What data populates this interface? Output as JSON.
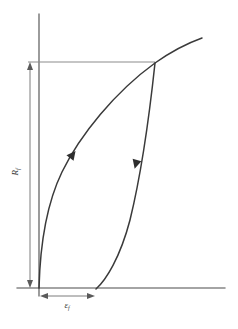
{
  "figure": {
    "background_color": "#ffffff",
    "width": 238,
    "height": 329
  },
  "labels": {
    "vertical_dimension": {
      "symbol": "R",
      "subscript": "f",
      "full_text": "Rf",
      "orientation": "rotated-90",
      "meaning": "strength at failure"
    },
    "horizontal_dimension": {
      "symbol": "ε",
      "subscript": "f",
      "full_text": "εf",
      "orientation": "horizontal",
      "meaning": "permanent strain at failure"
    }
  },
  "colors": {
    "axis": "#4a4a4a",
    "reference_line": "#8c8c8c",
    "dimension_line": "#6e6e6e",
    "curve": "#3a3a3a",
    "arrow": "#2e2e2e",
    "label_text": "#3a3a3a"
  },
  "chart_data": {
    "type": "line",
    "title": "",
    "xlabel": "εf",
    "ylabel": "Rf",
    "grid": false,
    "legend": false,
    "axes": {
      "vertical_axis": {
        "x": 39,
        "y_top": 14,
        "y_bottom": 296
      },
      "horizontal_axis": {
        "y": 288,
        "x_left": 17,
        "x_right": 225
      }
    },
    "annotations": [
      {
        "name": "upper-reference-line",
        "type": "horizontal-rule",
        "y": 62,
        "x_start": 28,
        "x_end": 155
      },
      {
        "name": "vertical-dimension-Rf",
        "type": "double-arrow",
        "x": 30,
        "y_start": 62,
        "y_end": 288,
        "label": "Rf"
      },
      {
        "name": "horizontal-dimension-epsilon-f",
        "type": "double-arrow",
        "y": 296,
        "x_start": 40,
        "x_end": 95,
        "label": "εf"
      }
    ],
    "series": [
      {
        "name": "loading-curve",
        "direction": "upward",
        "arrow_at": {
          "x": 70,
          "y": 158,
          "angle_deg": -52
        },
        "path": "M 39,288 C 40,250 46,205 62,172 C 80,135 115,92 155,63 C 172,51 188,43 202,38",
        "points": [
          {
            "x": 39,
            "y": 288
          },
          {
            "x": 45,
            "y": 230
          },
          {
            "x": 55,
            "y": 190
          },
          {
            "x": 70,
            "y": 158
          },
          {
            "x": 95,
            "y": 120
          },
          {
            "x": 125,
            "y": 88
          },
          {
            "x": 155,
            "y": 63
          },
          {
            "x": 180,
            "y": 48
          },
          {
            "x": 202,
            "y": 38
          }
        ]
      },
      {
        "name": "unloading-curve",
        "direction": "downward",
        "arrow_at": {
          "x": 137,
          "y": 160,
          "angle_deg": 105
        },
        "path": "M 155,63 C 150,110 141,175 130,220 C 120,258 106,280 96,289",
        "points": [
          {
            "x": 155,
            "y": 63
          },
          {
            "x": 148,
            "y": 118
          },
          {
            "x": 137,
            "y": 160
          },
          {
            "x": 128,
            "y": 212
          },
          {
            "x": 115,
            "y": 255
          },
          {
            "x": 96,
            "y": 289
          }
        ]
      }
    ]
  }
}
